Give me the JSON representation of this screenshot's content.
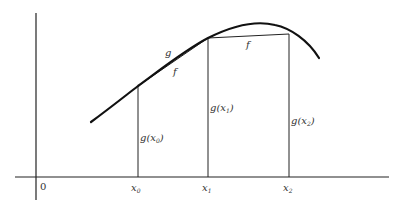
{
  "diagram": {
    "curve_label": "g",
    "chord_labels": [
      "f",
      "f"
    ],
    "origin_label": "0",
    "x_ticks": [
      "x",
      "x",
      "x"
    ],
    "x_subscripts": [
      "0",
      "1",
      "2"
    ],
    "ordinate_labels": [
      "g(x",
      "g(x",
      "g(x"
    ],
    "ordinate_subscripts": [
      "0",
      "1",
      "2"
    ],
    "close_paren": ")",
    "colors": {
      "stroke": "#1a1a1a",
      "text": "#333333",
      "background": "#ffffff"
    }
  }
}
